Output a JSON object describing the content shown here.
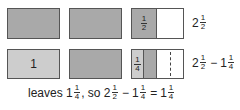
{
  "colors": {
    "dark_shade": "#a9a9a9",
    "light_shade": "#cdcdcd",
    "border": "#555555",
    "blank": "#ffffff"
  },
  "row1": {
    "third_box_fraction": {
      "num": "1",
      "den": "2"
    },
    "label": {
      "whole": "2",
      "num": "1",
      "den": "2"
    }
  },
  "row2": {
    "first_box_label": "1",
    "third_box_fraction": {
      "num": "1",
      "den": "4"
    },
    "label": {
      "a_whole": "2",
      "a_num": "1",
      "a_den": "2",
      "op": "−",
      "b_whole": "1",
      "b_num": "1",
      "b_den": "4"
    }
  },
  "caption": {
    "prefix": "leaves",
    "r_whole": "1",
    "r_num": "1",
    "r_den": "4",
    "mid": ", so",
    "a_whole": "2",
    "a_num": "1",
    "a_den": "2",
    "op": "−",
    "b_whole": "1",
    "b_num": "1",
    "b_den": "4",
    "eq": "=",
    "c_whole": "1",
    "c_num": "1",
    "c_den": "4"
  }
}
